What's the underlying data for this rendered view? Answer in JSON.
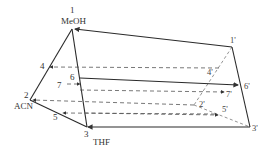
{
  "diagram": {
    "type": "prism solvent mixture design",
    "vertices": {
      "v1": {
        "label": "1",
        "solvent": "MeOH"
      },
      "v2": {
        "label": "2",
        "solvent": "ACN"
      },
      "v3": {
        "label": "3",
        "solvent": "THF"
      },
      "v1p": {
        "label": "1'"
      },
      "v2p": {
        "label": "2'"
      },
      "v3p": {
        "label": "3'"
      }
    },
    "points": {
      "p4": "4",
      "p5": "5",
      "p6": "6",
      "p7": "7",
      "p4p": "4'",
      "p5p": "5'",
      "p6p": "6'",
      "p7p": "7'"
    },
    "colors": {
      "line": "#2a2a2a",
      "dash": "#555555",
      "text": "#333333",
      "background": "#ffffff"
    }
  }
}
